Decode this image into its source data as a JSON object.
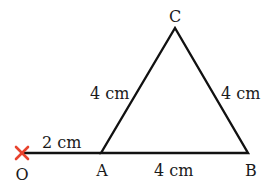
{
  "diagram": {
    "points": {
      "O": {
        "label": "O",
        "x": 22,
        "y": 153
      },
      "A": {
        "label": "A",
        "x": 101,
        "y": 153
      },
      "B": {
        "label": "B",
        "x": 248,
        "y": 153
      },
      "C": {
        "label": "C",
        "x": 175,
        "y": 28
      }
    },
    "measurements": {
      "OA": "2 cm",
      "AB": "4 cm",
      "AC": "4 cm",
      "BC": "4 cm"
    },
    "colors": {
      "line": "#111111",
      "cross": "#e8432e",
      "text": "#1a1a1a"
    }
  }
}
